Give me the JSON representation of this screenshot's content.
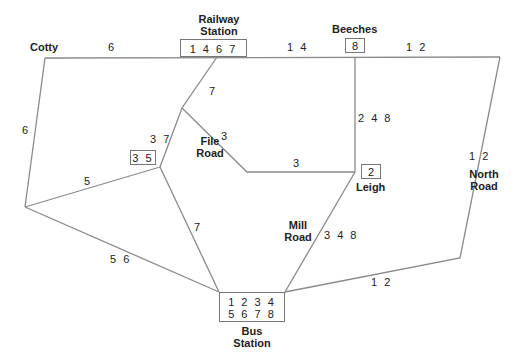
{
  "places": {
    "cotty": "Cotty",
    "railway_station": [
      "Railway",
      "Station"
    ],
    "beeches": "Beeches",
    "file_road": [
      "File",
      "Road"
    ],
    "leigh": "Leigh",
    "mill_road": [
      "Mill",
      "Road"
    ],
    "north_road": [
      "North",
      "Road"
    ],
    "bus_station": [
      "Bus",
      "Station"
    ]
  },
  "stop_boxes": {
    "railway_station": "1 4 6 7",
    "beeches": "8",
    "file_road": "3 5",
    "leigh": "2",
    "bus_station_row1": "1 2 3 4",
    "bus_station_row2": "5 6 7 8"
  },
  "route_labels": {
    "cotty_railway": "6",
    "railway_beeches": "1 4",
    "beeches_east": "1 2",
    "cotty_west": "6",
    "railway_file": "7",
    "file_road_upper": "3 7",
    "file_leigh_diag": "3",
    "file_leigh_horiz": "3",
    "beeches_leigh": "2 4 8",
    "west_file": "5",
    "file_bus": "7",
    "west_bus": "5 6",
    "mill_road": "3 4 8",
    "north_road": "1 2",
    "bus_east": "1 2"
  },
  "colors": {
    "line": "#8a8a8a",
    "text": "#222222"
  }
}
